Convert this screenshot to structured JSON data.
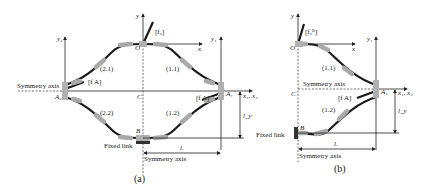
{
  "panels": [
    {
      "caption": "(a)",
      "labels": {
        "origin": "O",
        "y": "y",
        "x": "x",
        "y2": "y₂",
        "y1": "y₁",
        "center": "C",
        "A2": "A₂",
        "A1": "A₁",
        "B": "B",
        "x1x2": "x₁, x₂",
        "f0": "[f₀]",
        "fA_left": "[f A]",
        "fA_right": "[f A]",
        "seg_11": "(1.1)",
        "seg_21": "(2.1)",
        "seg_22": "(2.2)",
        "seg_12": "(1.2)",
        "symmetry_axis_h": "Symmetry axis",
        "symmetry_axis_v": "Symmetry axis",
        "fixed_link": "Fixed link",
        "lx": "lₓ",
        "ly": "l_y"
      }
    },
    {
      "caption": "(b)",
      "labels": {
        "origin": "O",
        "y": "y",
        "x": "x",
        "y1": "y₁",
        "center": "C",
        "A1": "A₁",
        "B": "B",
        "x1x2": "x₁, x₂",
        "f0": "[f₀ᴿ]",
        "fA": "[f A]",
        "seg_11": "(1.1)",
        "seg_12": "(1.2)",
        "symmetry_axis_h": "Symmetry axis",
        "symmetry_axis_v": "Symmetry axis",
        "fixed_link": "Fixed link",
        "lx": "lₓ",
        "ly": "l_y"
      }
    }
  ]
}
